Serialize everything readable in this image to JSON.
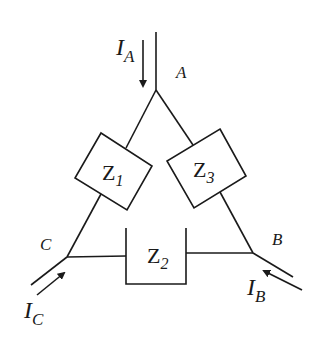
{
  "diagram": {
    "type": "delta-connected three-phase load",
    "nodes": {
      "A": "A",
      "B": "B",
      "C": "C"
    },
    "impedances": [
      {
        "id": "Z1",
        "main": "Z",
        "sub": "1",
        "between": "A-C"
      },
      {
        "id": "Z2",
        "main": "Z",
        "sub": "2",
        "between": "C-B"
      },
      {
        "id": "Z3",
        "main": "Z",
        "sub": "3",
        "between": "A-B"
      }
    ],
    "currents": [
      {
        "id": "IA",
        "main": "I",
        "sub": "A",
        "direction": "into node A"
      },
      {
        "id": "IB",
        "main": "I",
        "sub": "B",
        "direction": "into node B"
      },
      {
        "id": "IC",
        "main": "I",
        "sub": "C",
        "direction": "into node C"
      }
    ],
    "colors": {
      "line": "#1a1a1a",
      "background": "#ffffff"
    }
  }
}
